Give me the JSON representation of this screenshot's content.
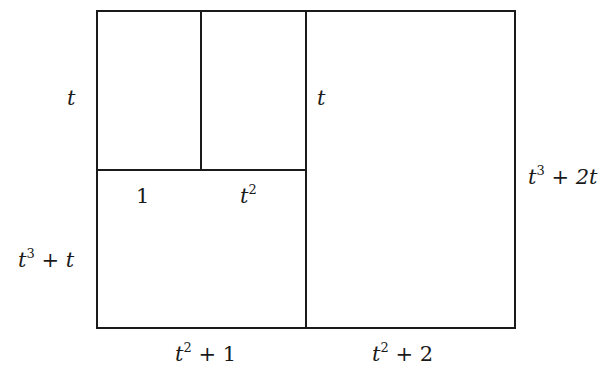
{
  "diagram": {
    "type": "area-model-rectangle",
    "line_color": "#1a1a1a",
    "labels": {
      "left_top": {
        "var": "t"
      },
      "inner_middle": {
        "var": "t"
      },
      "inner_bottom_1": {
        "text": "1"
      },
      "inner_bottom_t2": {
        "var": "t",
        "exp": "2"
      },
      "left_bottom": {
        "var": "t",
        "exp": "3",
        "rest": " + t"
      },
      "right": {
        "var": "t",
        "exp": "3",
        "rest": " + 2t"
      },
      "bottom_left": {
        "var": "t",
        "exp": "2",
        "rest": " + 1"
      },
      "bottom_right": {
        "var": "t",
        "exp": "2",
        "rest": " + 2"
      }
    }
  }
}
